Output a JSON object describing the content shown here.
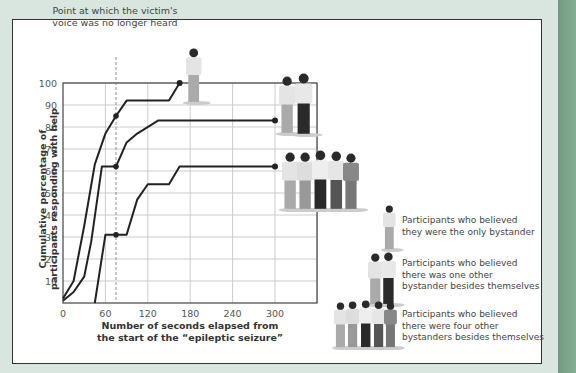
{
  "annotation": {
    "line1": "Point at which the victim's",
    "line2": "voice was no longer heard"
  },
  "axes": {
    "ylabel_line1": "Cumulative percentage of",
    "ylabel_line2": "participants responding with help",
    "xlabel_line1": "Number of seconds elapsed from",
    "xlabel_line2": "the start of the “epileptic seizure”",
    "xticks": [
      "0",
      "60",
      "120",
      "180",
      "240",
      "300"
    ],
    "yticks": [
      "10",
      "20",
      "30",
      "40",
      "50",
      "60",
      "70",
      "80",
      "90",
      "100"
    ]
  },
  "legend": [
    {
      "line1": "Participants who believed",
      "line2": "they were the only bystander",
      "line3": ""
    },
    {
      "line1": "Participants who believed",
      "line2": "there was one other",
      "line3": "bystander besides themselves"
    },
    {
      "line1": "Participants who believed",
      "line2": "there were four other",
      "line3": "bystanders besides themselves"
    }
  ],
  "chart_data": {
    "type": "line",
    "title": "",
    "xlabel": "Number of seconds elapsed from the start of the “epileptic seizure”",
    "ylabel": "Cumulative percentage of participants responding with help",
    "xlim": [
      0,
      360
    ],
    "ylim": [
      0,
      100
    ],
    "xticks": [
      0,
      60,
      120,
      180,
      240,
      300
    ],
    "yticks": [
      10,
      20,
      30,
      40,
      50,
      60,
      70,
      80,
      90,
      100
    ],
    "grid": true,
    "annotations": [
      {
        "x": 75,
        "text": "Point at which the victim's voice was no longer heard",
        "style": "dashed vertical line"
      }
    ],
    "series": [
      {
        "name": "Participants who believed they were the only bystander",
        "x": [
          0,
          15,
          30,
          45,
          60,
          75,
          90,
          150,
          165
        ],
        "y": [
          2,
          10,
          35,
          63,
          77,
          85,
          92,
          92,
          100
        ]
      },
      {
        "name": "Participants who believed there was one other bystander besides themselves",
        "x": [
          0,
          15,
          30,
          40,
          55,
          75,
          90,
          105,
          135,
          300
        ],
        "y": [
          1,
          5,
          12,
          28,
          62,
          62,
          73,
          77,
          83,
          83
        ]
      },
      {
        "name": "Participants who believed there were four other bystanders besides themselves",
        "x": [
          45,
          60,
          75,
          90,
          105,
          120,
          150,
          165,
          300
        ],
        "y": [
          0,
          31,
          31,
          31,
          47,
          54,
          54,
          62,
          62
        ]
      }
    ]
  }
}
